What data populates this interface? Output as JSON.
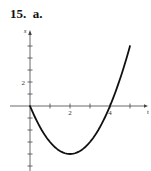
{
  "problem_label": "15.  a.",
  "chart_data": {
    "type": "line",
    "title": "",
    "xlabel": "t",
    "ylabel": "s",
    "function": "s = t^2 - 4t",
    "x": [
      0,
      0.5,
      1,
      1.5,
      2,
      2.5,
      3,
      3.5,
      4,
      4.5,
      5
    ],
    "series": [
      {
        "name": "s(t)",
        "values": [
          0,
          -1.75,
          -3,
          -3.75,
          -4,
          -3.75,
          -3,
          -1.75,
          0,
          2.25,
          5
        ]
      }
    ],
    "x_ticks": [
      1,
      2,
      3,
      4,
      5
    ],
    "x_tick_labels": {
      "2": "2",
      "4": "4"
    },
    "y_ticks": [
      -5,
      -4,
      -3,
      -2,
      -1,
      1,
      2,
      3,
      4,
      5
    ],
    "y_tick_labels": {
      "2": "2"
    },
    "xlim": [
      -1,
      6
    ],
    "ylim": [
      -5.3,
      6
    ],
    "grid": false,
    "legend": "none",
    "line_color": "#111111",
    "axis_color": "#444444"
  }
}
